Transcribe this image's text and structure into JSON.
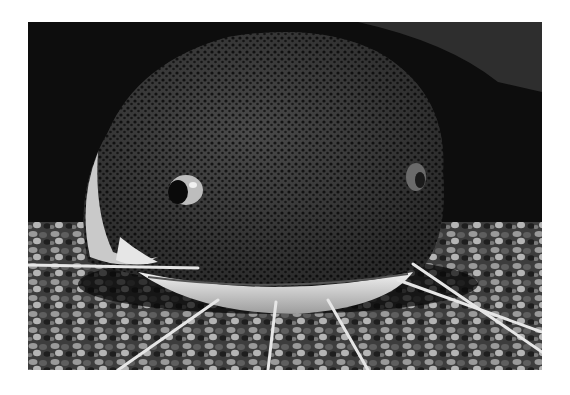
{
  "image": {
    "subject": "catfish head close-up with barbels resting on gravel",
    "style": "black-and-white photograph",
    "colors": {
      "border": "#ffffff",
      "background": "#0b0b0b",
      "body": "#3a3a3a",
      "belly": "#d9d9d9",
      "gravel": "#8a8a8a"
    }
  }
}
